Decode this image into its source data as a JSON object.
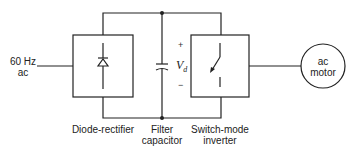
{
  "diagram": {
    "type": "block-diagram",
    "title": "",
    "input": {
      "line1": "60 Hz",
      "line2": "ac"
    },
    "blocks": [
      {
        "id": "rectifier",
        "label": "Diode-rectifier",
        "symbol": "diode"
      },
      {
        "id": "capacitor",
        "label_line1": "Filter",
        "label_line2": "capacitor",
        "symbol": "capacitor"
      },
      {
        "id": "inverter",
        "label_line1": "Switch-mode",
        "label_line2": "inverter",
        "symbol": "switch"
      }
    ],
    "dc_link": {
      "voltage_symbol": "V",
      "voltage_subscript": "d",
      "plus": "+",
      "minus": "−"
    },
    "load": {
      "line1": "ac",
      "line2": "motor"
    },
    "colors": {
      "line": "#222222",
      "background": "#ffffff"
    }
  }
}
